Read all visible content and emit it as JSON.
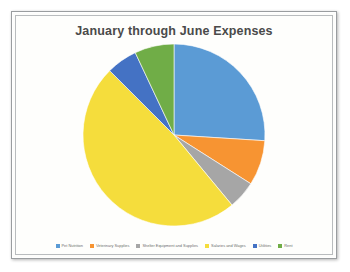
{
  "chart_data": {
    "type": "pie",
    "title": "January through June Expenses",
    "categories": [
      "Pet Nutrition",
      "Veterinary Supplies",
      "Shelter Equipment and Supplies",
      "Salaries and Wages",
      "Utilities",
      "Rent"
    ],
    "values": [
      26,
      8,
      5,
      48.5,
      5.5,
      7
    ],
    "colors": [
      "#5b9bd5",
      "#f79432",
      "#a6a6a6",
      "#f5dd3c",
      "#4472c4",
      "#70ad47"
    ],
    "start_angle_deg": 0,
    "direction": "clockwise",
    "legend_position": "bottom",
    "grid": false,
    "xlabel": "",
    "ylabel": "",
    "data_labels_shown": false
  },
  "frame": {
    "border_color": "#9a9d9f",
    "background": "#fdfdfb"
  }
}
